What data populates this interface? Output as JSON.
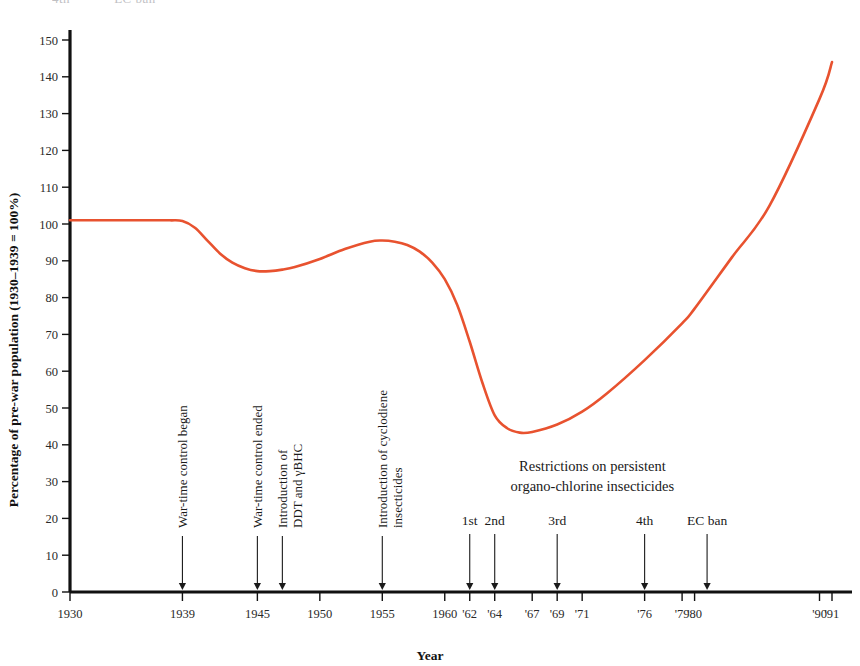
{
  "figure": {
    "clipped_header_left": "4th",
    "clipped_header_right": "EC ban"
  },
  "chart_data": {
    "type": "line",
    "title": "",
    "xlabel": "Year",
    "ylabel": "Percentage of pre-war population (1930–1939 = 100%)",
    "xlim": [
      1930,
      1991
    ],
    "ylim": [
      0,
      155
    ],
    "grid": false,
    "legend": "none",
    "series_color": "#e8522f",
    "x_tick_labels": [
      "1930",
      "1939",
      "1945",
      "1950",
      "1955",
      "1960",
      "'62",
      "'64",
      "'67",
      "'69",
      "'71",
      "'76",
      "'79",
      "'80",
      "'90",
      "'91"
    ],
    "x_tick_values": [
      1930,
      1939,
      1945,
      1950,
      1955,
      1960,
      1962,
      1964,
      1967,
      1969,
      1971,
      1976,
      1979,
      1980,
      1990,
      1991
    ],
    "y_tick_labels": [
      "0",
      "10",
      "20",
      "30",
      "40",
      "50",
      "60",
      "70",
      "80",
      "90",
      "100",
      "110",
      "120",
      "130",
      "140",
      "150"
    ],
    "y_tick_values": [
      0,
      10,
      20,
      30,
      40,
      50,
      60,
      70,
      80,
      90,
      100,
      110,
      120,
      130,
      140,
      150
    ],
    "series": [
      {
        "name": "Percentage of pre-war population",
        "x": [
          1930,
          1933,
          1936,
          1938,
          1939,
          1940,
          1941,
          1942,
          1943,
          1944,
          1945,
          1946,
          1947,
          1948,
          1950,
          1952,
          1954,
          1955,
          1956,
          1957,
          1958,
          1959,
          1960,
          1961,
          1962,
          1963,
          1964,
          1965,
          1966,
          1967,
          1969,
          1971,
          1973,
          1976,
          1979,
          1980,
          1983,
          1986,
          1990,
          1991
        ],
        "values": [
          101,
          101,
          101,
          101,
          100.8,
          99,
          95.5,
          92,
          89.5,
          88,
          87.2,
          87.2,
          87.6,
          88.3,
          90.5,
          93.2,
          95.2,
          95.5,
          95.2,
          94.3,
          92.5,
          89.5,
          85,
          78,
          68,
          57,
          48,
          44.5,
          43.3,
          43.5,
          45.5,
          49,
          54,
          63,
          73,
          77,
          91,
          105,
          134,
          144
        ]
      }
    ],
    "annotations": [
      {
        "label": "War-time control began",
        "year": 1939,
        "orientation": "vertical",
        "lines": [
          "War-time control began"
        ]
      },
      {
        "label": "War-time control ended",
        "year": 1945,
        "orientation": "vertical",
        "lines": [
          "War-time control ended"
        ]
      },
      {
        "label": "Introduction of DDT and γBHC",
        "year": 1947,
        "orientation": "vertical",
        "lines": [
          "Introduction of",
          "DDT and γBHC"
        ]
      },
      {
        "label": "Introduction of cyclodiene insecticides",
        "year": 1955,
        "orientation": "vertical",
        "lines": [
          "Introduction of cyclodiene",
          "insecticides"
        ]
      },
      {
        "label": "1st",
        "year": 1962,
        "orientation": "horizontal",
        "group": "restrictions"
      },
      {
        "label": "2nd",
        "year": 1964,
        "orientation": "horizontal",
        "group": "restrictions"
      },
      {
        "label": "3rd",
        "year": 1969,
        "orientation": "horizontal",
        "group": "restrictions"
      },
      {
        "label": "4th",
        "year": 1976,
        "orientation": "horizontal",
        "group": "restrictions"
      },
      {
        "label": "EC ban",
        "year": 1981,
        "orientation": "horizontal",
        "group": "restrictions"
      }
    ],
    "annotation_group_title": [
      "Restrictions on persistent",
      "organo-chlorine insecticides"
    ]
  }
}
